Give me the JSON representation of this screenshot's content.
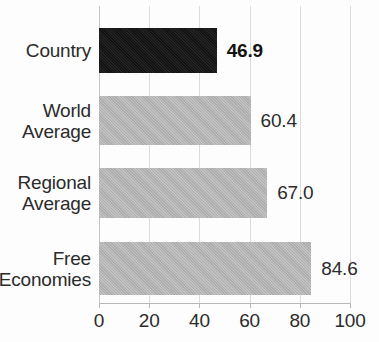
{
  "chart_data": {
    "type": "bar",
    "orientation": "horizontal",
    "title": "",
    "xlabel": "",
    "ylabel": "",
    "xlim": [
      0,
      100
    ],
    "grid": "vertical",
    "legend": "none",
    "categories": [
      "Country",
      "World Average",
      "Regional Average",
      "Free Economies"
    ],
    "values": [
      46.9,
      60.4,
      67.0,
      84.6
    ],
    "value_labels": [
      "46.9",
      "60.4",
      "67.0",
      "84.6"
    ],
    "xticks": [
      0,
      20,
      40,
      60,
      80,
      100
    ],
    "xtick_labels": [
      "0",
      "20",
      "40",
      "60",
      "80",
      "100"
    ],
    "bars": [
      {
        "category": "Country",
        "category_lines": [
          "Country"
        ],
        "value": 46.9,
        "value_label": "46.9",
        "color": "#171717",
        "highlighted": true,
        "label_bold": true
      },
      {
        "category": "World Average",
        "category_lines": [
          "World",
          "Average"
        ],
        "value": 60.4,
        "value_label": "60.4",
        "color": "#b6b6b6",
        "highlighted": false,
        "label_bold": false
      },
      {
        "category": "Regional Average",
        "category_lines": [
          "Regional",
          "Average"
        ],
        "value": 67.0,
        "value_label": "67.0",
        "color": "#b6b6b6",
        "highlighted": false,
        "label_bold": false
      },
      {
        "category": "Free Economies",
        "category_lines": [
          "Free",
          "Economies"
        ],
        "value": 84.6,
        "value_label": "84.6",
        "color": "#b6b6b6",
        "highlighted": false,
        "label_bold": false
      }
    ]
  },
  "style": {
    "gridline_color": "#dcdcdc",
    "axis_color": "#b9b9b9",
    "text_color": "#2b2b2b",
    "background": "#fdfdfd",
    "highlight_color": "#171717",
    "bar_color": "#b6b6b6"
  }
}
